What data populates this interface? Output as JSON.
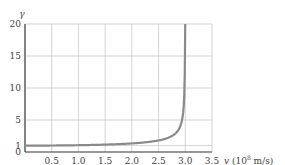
{
  "chart_data": {
    "type": "line",
    "title": "",
    "xlabel": "v",
    "xunit": "(10",
    "xunit_exp": "8",
    "xunit_tail": " m/s)",
    "ylabel": "γ",
    "xlim": [
      0,
      3.5
    ],
    "ylim": [
      0,
      20
    ],
    "grid": true,
    "legend": "none",
    "x_ticks": [
      "0.5",
      "1.0",
      "1.5",
      "2.0",
      "2.5",
      "3.0",
      "3.5"
    ],
    "y_ticks": [
      "0",
      "1",
      "5",
      "10",
      "15",
      "20"
    ],
    "series": [
      {
        "name": "gamma(v) = 1/sqrt(1 - v^2/c^2)",
        "color": "#8a8a8a",
        "x": [
          0,
          0.5,
          1.0,
          1.5,
          2.0,
          2.5,
          2.7,
          2.8,
          2.9,
          2.95,
          2.98,
          2.99,
          2.995
        ],
        "values": [
          1.0,
          1.01,
          1.06,
          1.15,
          1.34,
          1.81,
          2.29,
          2.78,
          3.91,
          5.48,
          8.64,
          12.2,
          17.3
        ]
      }
    ],
    "asymptote_x": 3.0,
    "tick_label_zero": "0"
  }
}
